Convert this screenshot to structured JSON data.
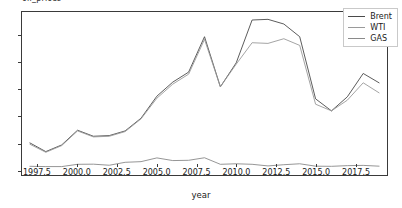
{
  "title": "oil_prices",
  "axes": {
    "xlabel": "year",
    "ylabel": "",
    "xticks": [
      "1997.5",
      "2000.0",
      "2002.5",
      "2005.0",
      "2007.5",
      "2010.0",
      "2012.5",
      "2015.0",
      "2017.5"
    ],
    "yticks": [
      "0",
      "20",
      "40",
      "60",
      "80",
      "100"
    ]
  },
  "legend": {
    "position": "upper-right",
    "entries": [
      {
        "label": "Brent",
        "color": "#4a4a4a"
      },
      {
        "label": "WTI",
        "color": "#9a9a9a"
      },
      {
        "label": "GAS",
        "color": "#8a8a8a"
      }
    ]
  },
  "chart_data": {
    "type": "line",
    "title": "oil_prices",
    "xlabel": "year",
    "ylabel": "",
    "xlim": [
      1996.5,
      2019.5
    ],
    "ylim": [
      -4,
      118
    ],
    "xticks": [
      1997.5,
      2000.0,
      2002.5,
      2005.0,
      2007.5,
      2010.0,
      2012.5,
      2015.0,
      2017.5
    ],
    "yticks": [
      0,
      20,
      40,
      60,
      80,
      100
    ],
    "grid": false,
    "legend_position": "upper right",
    "x": [
      1997,
      1998,
      1999,
      2000,
      2001,
      2002,
      2003,
      2004,
      2005,
      2006,
      2007,
      2008,
      2009,
      2010,
      2011,
      2012,
      2013,
      2014,
      2015,
      2016,
      2017,
      2018,
      2019
    ],
    "series": [
      {
        "name": "Brent",
        "color": "#4a4a4a",
        "values": [
          20.0,
          13.5,
          18.5,
          29.5,
          25.0,
          25.5,
          29.0,
          38.5,
          55.0,
          65.5,
          73.0,
          99.5,
          62.0,
          80.0,
          112.0,
          112.5,
          109.0,
          99.5,
          53.0,
          44.0,
          54.5,
          72.0,
          65.0
        ]
      },
      {
        "name": "WTI",
        "color": "#9a9a9a",
        "values": [
          19.0,
          13.0,
          18.0,
          29.0,
          24.5,
          25.0,
          28.5,
          38.0,
          53.5,
          64.0,
          71.5,
          97.5,
          62.0,
          79.0,
          95.0,
          94.5,
          98.0,
          93.0,
          49.0,
          44.0,
          52.0,
          65.0,
          57.5
        ]
      },
      {
        "name": "GAS",
        "color": "#8a8a8a",
        "values": [
          2.5,
          2.3,
          2.3,
          4.0,
          4.1,
          3.3,
          5.5,
          6.0,
          8.8,
          6.8,
          7.0,
          8.9,
          4.0,
          4.4,
          4.0,
          2.8,
          3.7,
          4.4,
          2.6,
          2.5,
          3.0,
          3.2,
          2.6
        ]
      }
    ]
  }
}
